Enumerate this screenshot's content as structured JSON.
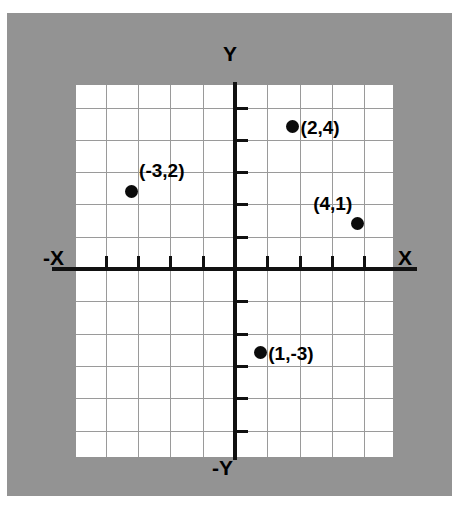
{
  "figure": {
    "background_color": "#ffffff",
    "frame_color": "#939393",
    "plot_background_color": "#ffffff",
    "grid_color": "#9a9a9a",
    "axis_color": "#111111",
    "point_color": "#0b0b0b"
  },
  "axis_labels": {
    "x_positive": "X",
    "x_negative": "-X",
    "y_positive": "Y",
    "y_negative": "-Y"
  },
  "chart_data": {
    "type": "scatter",
    "title": "",
    "xlabel": "X",
    "ylabel": "Y",
    "xlim": [
      -5,
      5
    ],
    "ylim": [
      -6,
      6
    ],
    "grid": true,
    "legend": "none",
    "x_ticks": [
      -4,
      -3,
      -2,
      -1,
      1,
      2,
      3,
      4
    ],
    "y_ticks": [
      -5,
      -4,
      -3,
      -2,
      -1,
      1,
      2,
      3,
      4,
      5
    ],
    "points": [
      {
        "label": "(2,4)",
        "x": 2,
        "y": 4,
        "label_side": "right"
      },
      {
        "label": "(-3,2)",
        "x": -3,
        "y": 2,
        "label_side": "above-right"
      },
      {
        "label": "(4,1)",
        "x": 4,
        "y": 1,
        "label_side": "above-left"
      },
      {
        "label": "(1,-3)",
        "x": 1,
        "y": -3,
        "label_side": "right"
      }
    ]
  }
}
